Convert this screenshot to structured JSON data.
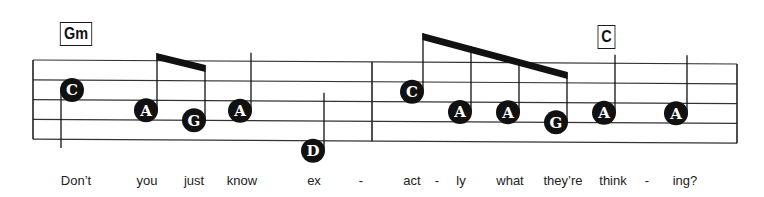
{
  "chords": [
    {
      "name": "Gm",
      "at_note": 0
    },
    {
      "name": "C",
      "at_note": 9
    }
  ],
  "clef": "treble",
  "staff_lines": 5,
  "measures": [
    {
      "notes": [
        {
          "letter": "C",
          "pitch": "C5",
          "duration": "quarter",
          "stem": "down"
        },
        {
          "letter": "A",
          "pitch": "A4",
          "duration": "eighth",
          "stem": "up",
          "beam_group": 1
        },
        {
          "letter": "G",
          "pitch": "G4",
          "duration": "eighth",
          "stem": "up",
          "beam_group": 1
        },
        {
          "letter": "A",
          "pitch": "A4",
          "duration": "quarter",
          "stem": "up"
        },
        {
          "letter": "D",
          "pitch": "D4",
          "duration": "quarter",
          "stem": "up"
        }
      ]
    },
    {
      "notes": [
        {
          "letter": "C",
          "pitch": "C5",
          "duration": "eighth",
          "stem": "up",
          "beam_group": 2
        },
        {
          "letter": "A",
          "pitch": "A4",
          "duration": "eighth",
          "stem": "up",
          "beam_group": 2
        },
        {
          "letter": "A",
          "pitch": "A4",
          "duration": "eighth",
          "stem": "up",
          "beam_group": 2
        },
        {
          "letter": "G",
          "pitch": "G4",
          "duration": "eighth",
          "stem": "up",
          "beam_group": 2
        },
        {
          "letter": "A",
          "pitch": "A4",
          "duration": "quarter",
          "stem": "up"
        },
        {
          "letter": "A",
          "pitch": "A4",
          "duration": "quarter",
          "stem": "up"
        }
      ]
    }
  ],
  "lyrics": [
    "Don’t",
    "you",
    "just",
    "know",
    "ex",
    "-",
    "act",
    "-",
    "ly",
    "what",
    "they’re",
    "think",
    "-",
    "ing?"
  ],
  "colors": {
    "ink": "#111111",
    "note_text": "#ffffff",
    "background": "#ffffff"
  }
}
